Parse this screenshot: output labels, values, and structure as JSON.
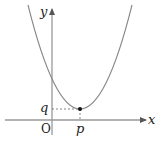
{
  "diagram": {
    "type": "parabola-graph",
    "labels": {
      "y_axis": "y",
      "x_axis": "x",
      "origin": "O",
      "vertex_x": "p",
      "vertex_y": "q"
    },
    "colors": {
      "curve": "#888888",
      "axis": "#999999",
      "text": "#222222",
      "point": "#111111"
    }
  }
}
